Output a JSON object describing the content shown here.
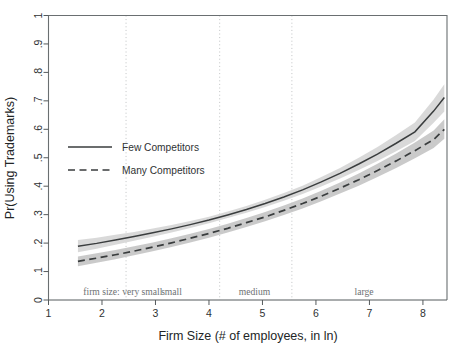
{
  "chart_data": {
    "type": "line",
    "title": "",
    "xlabel": "Firm Size (# of employees, in ln)",
    "ylabel": "Pr(Using Trademarks)",
    "xlim": [
      1.0,
      8.45
    ],
    "ylim": [
      0,
      1
    ],
    "grid": false,
    "legend_position": "inside-left",
    "xticks": [
      1,
      2,
      3,
      4,
      5,
      6,
      7,
      8
    ],
    "xticklabels": [
      "1",
      "2",
      "3",
      "4",
      "5",
      "6",
      "7",
      "8"
    ],
    "yticks": [
      0,
      0.1,
      0.2,
      0.3,
      0.4,
      0.5,
      0.6,
      0.7,
      0.8,
      0.9,
      1
    ],
    "yticklabels": [
      "0",
      ".1",
      ".2",
      ".3",
      ".4",
      ".5",
      ".6",
      ".7",
      ".8",
      ".9",
      "1"
    ],
    "x": [
      1.55,
      1.9,
      2.25,
      2.6,
      2.95,
      3.3,
      3.65,
      4.0,
      4.35,
      4.7,
      5.05,
      5.4,
      5.75,
      6.1,
      6.45,
      6.8,
      7.15,
      7.5,
      7.85,
      8.2,
      8.4
    ],
    "series": [
      {
        "name": "Few Competitors",
        "style": "solid",
        "color": "#3a3d3e",
        "values": [
          0.189,
          0.199,
          0.211,
          0.223,
          0.236,
          0.25,
          0.265,
          0.281,
          0.299,
          0.318,
          0.339,
          0.362,
          0.387,
          0.415,
          0.445,
          0.478,
          0.513,
          0.551,
          0.591,
          0.664,
          0.712
        ],
        "ci_lower": [
          0.168,
          0.18,
          0.194,
          0.208,
          0.222,
          0.237,
          0.253,
          0.27,
          0.288,
          0.307,
          0.327,
          0.349,
          0.373,
          0.399,
          0.427,
          0.457,
          0.489,
          0.523,
          0.559,
          0.623,
          0.663
        ],
        "ci_upper": [
          0.211,
          0.219,
          0.229,
          0.239,
          0.251,
          0.264,
          0.278,
          0.293,
          0.311,
          0.33,
          0.352,
          0.376,
          0.402,
          0.432,
          0.464,
          0.5,
          0.538,
          0.58,
          0.624,
          0.705,
          0.758
        ]
      },
      {
        "name": "Many Competitors",
        "style": "dashed",
        "color": "#3a3d3e",
        "values": [
          0.136,
          0.147,
          0.159,
          0.172,
          0.186,
          0.201,
          0.217,
          0.234,
          0.252,
          0.272,
          0.292,
          0.315,
          0.339,
          0.365,
          0.393,
          0.423,
          0.455,
          0.489,
          0.525,
          0.564,
          0.6
        ],
        "ci_lower": [
          0.119,
          0.131,
          0.143,
          0.157,
          0.171,
          0.186,
          0.202,
          0.219,
          0.237,
          0.257,
          0.277,
          0.299,
          0.322,
          0.347,
          0.374,
          0.402,
          0.432,
          0.464,
          0.498,
          0.534,
          0.567
        ],
        "ci_upper": [
          0.153,
          0.164,
          0.176,
          0.189,
          0.202,
          0.217,
          0.233,
          0.25,
          0.268,
          0.288,
          0.309,
          0.332,
          0.357,
          0.384,
          0.413,
          0.445,
          0.479,
          0.515,
          0.554,
          0.596,
          0.635
        ]
      }
    ],
    "category_dividers": [
      2.45,
      4.2,
      5.55
    ],
    "category_labels": [
      {
        "text": "firm size:  very small",
        "x": 1.65,
        "align": "start"
      },
      {
        "text": "small",
        "x": 3.3,
        "align": "middle"
      },
      {
        "text": "medium",
        "x": 4.85,
        "align": "middle"
      },
      {
        "text": "large",
        "x": 6.9,
        "align": "middle"
      }
    ],
    "legend": [
      {
        "label": "Few Competitors",
        "style": "solid"
      },
      {
        "label": "Many Competitors",
        "style": "dashed"
      }
    ],
    "colors": {
      "line": "#3a3d3e",
      "band_few": "#cfcfcf",
      "band_many": "#bdbdbd",
      "axis": "#555a5c",
      "divider": "#b9bcbd",
      "category_text": "#6d7173",
      "background": "#ffffff"
    }
  }
}
